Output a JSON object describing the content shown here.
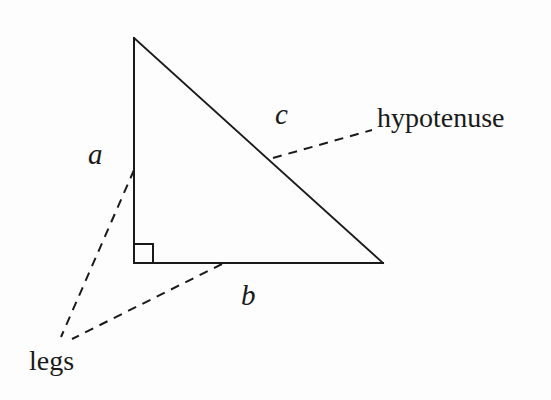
{
  "figure": {
    "background_color": "#fdfdfd",
    "stroke_color": "#1a1a1a",
    "labels": {
      "leg_a": "a",
      "leg_b": "b",
      "hypotenuse_side": "c",
      "hypotenuse_word": "hypotenuse",
      "legs_word": "legs"
    },
    "shapes": {
      "triangle": {
        "type": "right-triangle",
        "apex": [
          134,
          38
        ],
        "right_angle_vertex": [
          134,
          263
        ],
        "right_vertex": [
          383,
          263
        ],
        "stroke_width": 2
      },
      "right_angle_marker": {
        "x": 134,
        "y": 244,
        "size": 19,
        "stroke_width": 2
      },
      "leader_lines": [
        {
          "name": "hypotenuse-leader",
          "from": [
            273,
            158
          ],
          "to": [
            372,
            130
          ],
          "style": "dashed"
        },
        {
          "name": "leg-a-leader",
          "from": [
            134,
            170
          ],
          "to": [
            61,
            337
          ],
          "style": "dashed"
        },
        {
          "name": "leg-b-leader",
          "from": [
            222,
            264
          ],
          "to": [
            72,
            339
          ],
          "style": "dashed"
        }
      ]
    }
  }
}
